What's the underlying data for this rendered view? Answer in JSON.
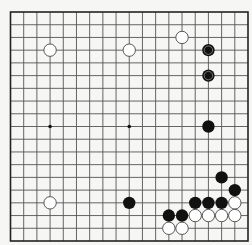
{
  "board": {
    "size": 19,
    "colors": {
      "background": "#f6f6f4",
      "line": "#555555",
      "border": "#222222",
      "black_stone": "#111111",
      "white_stone_fill": "#ffffff",
      "white_stone_stroke": "#444444",
      "star_point": "#111111"
    },
    "star_points_visible": [
      [
        3,
        9
      ],
      [
        9,
        9
      ]
    ],
    "stones": [
      {
        "color": "white",
        "col": 3,
        "row": 3
      },
      {
        "color": "white",
        "col": 9,
        "row": 3
      },
      {
        "color": "white",
        "col": 13,
        "row": 2
      },
      {
        "color": "black",
        "col": 15,
        "row": 3,
        "marked": true
      },
      {
        "color": "black",
        "col": 15,
        "row": 5,
        "marked": true
      },
      {
        "color": "black",
        "col": 15,
        "row": 9
      },
      {
        "color": "white",
        "col": 3,
        "row": 15
      },
      {
        "color": "black",
        "col": 9,
        "row": 15
      },
      {
        "color": "black",
        "col": 16,
        "row": 13
      },
      {
        "color": "black",
        "col": 17,
        "row": 14
      },
      {
        "color": "black",
        "col": 14,
        "row": 15
      },
      {
        "color": "black",
        "col": 15,
        "row": 15
      },
      {
        "color": "black",
        "col": 16,
        "row": 15
      },
      {
        "color": "white",
        "col": 17,
        "row": 15
      },
      {
        "color": "black",
        "col": 12,
        "row": 16
      },
      {
        "color": "black",
        "col": 13,
        "row": 16
      },
      {
        "color": "white",
        "col": 14,
        "row": 16
      },
      {
        "color": "white",
        "col": 15,
        "row": 16
      },
      {
        "color": "white",
        "col": 16,
        "row": 16
      },
      {
        "color": "white",
        "col": 17,
        "row": 16
      },
      {
        "color": "white",
        "col": 12,
        "row": 17
      },
      {
        "color": "white",
        "col": 13,
        "row": 17
      }
    ]
  }
}
